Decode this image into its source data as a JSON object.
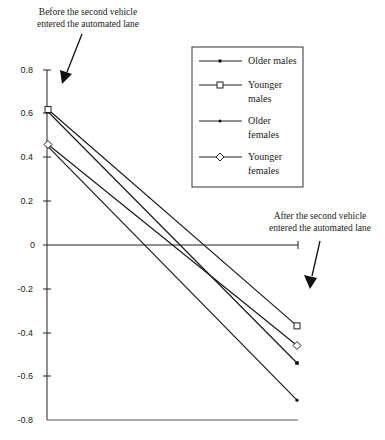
{
  "chart_data": {
    "type": "line",
    "title": "",
    "xlabel": "",
    "ylabel": "",
    "ylim": [
      -0.8,
      0.8
    ],
    "yticks": [
      "0.8",
      "0.6",
      "0.4",
      "0.2",
      "0",
      "-0.2",
      "-0.4",
      "-0.6",
      "-0.8"
    ],
    "x": [
      "Before",
      "After"
    ],
    "grid": false,
    "legend_position": "upper right (inside box)",
    "series": [
      {
        "name": "Older males",
        "marker": "filled-square",
        "values": [
          0.61,
          -0.54
        ]
      },
      {
        "name": "Younger males",
        "marker": "open-square",
        "values": [
          0.62,
          -0.37
        ]
      },
      {
        "name": "Older females",
        "marker": "dot",
        "values": [
          0.45,
          -0.71
        ]
      },
      {
        "name": "Younger females",
        "marker": "open-diamond",
        "values": [
          0.46,
          -0.46
        ]
      }
    ],
    "annotations": [
      {
        "text_line1": "Before the second vehicle",
        "text_line2": "entered the automated lane",
        "position": "top-left"
      },
      {
        "text_line1": "After the second vehicle",
        "text_line2": "entered the automated lane",
        "position": "right"
      }
    ]
  },
  "legend": {
    "items": [
      {
        "line1": "Older males",
        "line2": ""
      },
      {
        "line1": "Younger",
        "line2": "males"
      },
      {
        "line1": "Older",
        "line2": "females"
      },
      {
        "line1": "Younger",
        "line2": "females"
      }
    ]
  }
}
